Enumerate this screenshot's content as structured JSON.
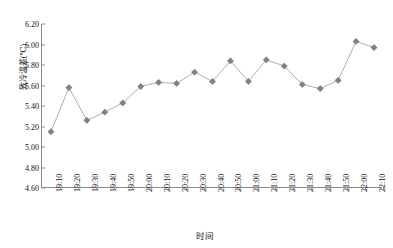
{
  "chart_data": {
    "type": "line",
    "title": "",
    "xlabel": "时间",
    "ylabel": "致冷温差(℃)",
    "ylim": [
      4.6,
      6.2
    ],
    "ytick_step": 0.2,
    "ytick_labels": [
      "6.20",
      "6.00",
      "5.80",
      "5.60",
      "5.40",
      "5.20",
      "5.00",
      "4.80",
      "4.60"
    ],
    "ytick_values": [
      6.2,
      6.0,
      5.8,
      5.6,
      5.4,
      5.2,
      5.0,
      4.8,
      4.6
    ],
    "grid": false,
    "legend": "none",
    "marker": "diamond",
    "marker_color": "#808080",
    "line_color": "#b0b0b0",
    "axis_color": "#8a8a8a",
    "categories": [
      "19:10",
      "19:20",
      "19:30",
      "19:40",
      "19:50",
      "20:00",
      "20:10",
      "20:20",
      "20:30",
      "20:40",
      "20:50",
      "21:00",
      "21:10",
      "21:20",
      "21:30",
      "21:40",
      "21:50",
      "22:00",
      "22:10"
    ],
    "values": [
      5.15,
      5.58,
      5.26,
      5.34,
      5.43,
      5.59,
      5.63,
      5.62,
      5.73,
      5.64,
      5.84,
      5.64,
      5.85,
      5.79,
      5.61,
      5.57,
      5.65,
      6.03,
      5.97
    ],
    "series": [
      {
        "name": "致冷温差",
        "values": [
          5.15,
          5.58,
          5.26,
          5.34,
          5.43,
          5.59,
          5.63,
          5.62,
          5.73,
          5.64,
          5.84,
          5.64,
          5.85,
          5.79,
          5.61,
          5.57,
          5.65,
          6.03,
          5.97
        ]
      }
    ]
  }
}
